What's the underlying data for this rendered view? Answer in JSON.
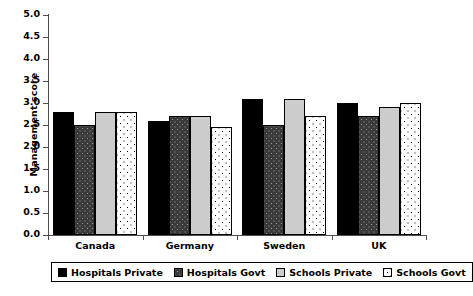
{
  "chart_data": {
    "type": "bar",
    "title": "",
    "xlabel": "",
    "ylabel": "Management score",
    "ylim": [
      0.0,
      5.0
    ],
    "ytick_labels": [
      "5.0",
      "4.5",
      "4.0",
      "3.5",
      "3.0",
      "2.5",
      "2.0",
      "1.5",
      "1.0",
      "0.5",
      "0.0"
    ],
    "ytick_values": [
      5.0,
      4.5,
      4.0,
      3.5,
      3.0,
      2.5,
      2.0,
      1.5,
      1.0,
      0.5,
      0.0
    ],
    "grid": false,
    "legend_position": "bottom",
    "categories": [
      "Canada",
      "Germany",
      "Sweden",
      "UK"
    ],
    "series": [
      {
        "name": "Hospitals Private",
        "color": "#000000",
        "pattern": "solid-black",
        "values": [
          2.8,
          2.6,
          3.1,
          3.0
        ]
      },
      {
        "name": "Hospitals Govt",
        "color": "#3a3a3a",
        "pattern": "dark-speckled",
        "values": [
          2.5,
          2.7,
          2.5,
          2.7
        ]
      },
      {
        "name": "Schools Private",
        "color": "#cccccc",
        "pattern": "solid-light-gray",
        "values": [
          2.8,
          2.7,
          3.1,
          2.9
        ]
      },
      {
        "name": "Schools Govt",
        "color": "#ffffff",
        "pattern": "white-dotted",
        "values": [
          2.8,
          2.45,
          2.7,
          3.0
        ]
      }
    ]
  }
}
